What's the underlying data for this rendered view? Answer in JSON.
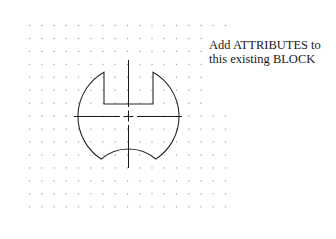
{
  "drawing": {
    "type": "cad-block",
    "description": "Symmetric block outline with top rectangular notch, concave bottom, and dashed center lines",
    "grid": {
      "columns": 17,
      "rows": 15,
      "dot_color": "#a0a0a0"
    },
    "line_color": "#2a2a2a",
    "centerline_color": "#1a1a1a"
  },
  "annotation": {
    "lines": [
      "Add ATTRIBUTES to",
      "this existing BLOCK"
    ]
  }
}
